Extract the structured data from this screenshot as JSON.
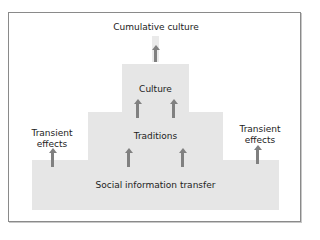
{
  "diagram": {
    "title_top": "Cumulative culture",
    "levels": [
      {
        "label": "Culture"
      },
      {
        "label": "Traditions"
      },
      {
        "label": "Social information transfer"
      }
    ],
    "side_labels": {
      "left": "Transient\neffects",
      "right": "Transient\neffects"
    },
    "colors": {
      "box": "#e6e6e6",
      "arrow": "#808080",
      "border": "#8a8a8a"
    }
  }
}
